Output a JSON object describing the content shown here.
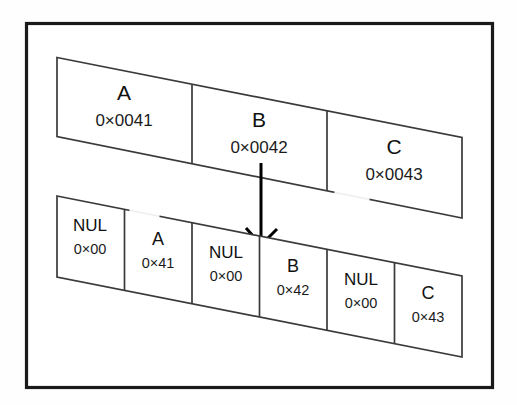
{
  "figure": {
    "background_color": "#fefefe",
    "frame_color": "#1a1a1a",
    "line_color": "#3a3a3a",
    "arrow_color": "#000000"
  },
  "top_row": {
    "name": "wide-character-row",
    "cells": [
      {
        "char": "A",
        "code": "0×0041"
      },
      {
        "char": "B",
        "code": "0×0042"
      },
      {
        "char": "C",
        "code": "0×0043"
      }
    ]
  },
  "bottom_row": {
    "name": "byte-sequence-row",
    "cells": [
      {
        "char": "NUL",
        "code": "0×00"
      },
      {
        "char": "A",
        "code": "0×41"
      },
      {
        "char": "NUL",
        "code": "0×00"
      },
      {
        "char": "B",
        "code": "0×42"
      },
      {
        "char": "NUL",
        "code": "0×00"
      },
      {
        "char": "C",
        "code": "0×43"
      }
    ]
  },
  "arrow": {
    "name": "expansion-arrow",
    "direction": "down",
    "from_cell": "B",
    "to_cell": "NUL / B"
  }
}
